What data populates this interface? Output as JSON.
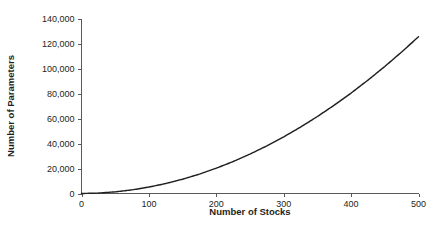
{
  "chart_data": {
    "type": "line",
    "title": "",
    "subtitle": "",
    "xlabel": "Number of Stocks",
    "ylabel": "Number of Parameters",
    "xlim": [
      0,
      500
    ],
    "ylim": [
      0,
      140000
    ],
    "xticks": [
      0,
      100,
      200,
      300,
      400,
      500
    ],
    "xtick_labels": [
      "0",
      "100",
      "200",
      "300",
      "400",
      "500"
    ],
    "yticks": [
      0,
      20000,
      40000,
      60000,
      80000,
      100000,
      120000,
      140000
    ],
    "ytick_labels": [
      "0",
      "20,000",
      "40,000",
      "60,000",
      "80,000",
      "100,000",
      "120,000",
      "140,000"
    ],
    "grid": false,
    "legend": false,
    "legend_position": "none",
    "series": [
      {
        "name": "Number of Parameters",
        "color": "#231f20",
        "formula": "N(N+3)/2",
        "x": [
          0,
          25,
          50,
          75,
          100,
          125,
          150,
          175,
          200,
          225,
          250,
          275,
          300,
          325,
          350,
          375,
          400,
          425,
          450,
          475,
          500
        ],
        "values": [
          0,
          350,
          1325,
          2925,
          5150,
          8000,
          11475,
          15575,
          20300,
          25650,
          31625,
          38225,
          45450,
          53300,
          61775,
          70875,
          80600,
          90950,
          101925,
          113525,
          125750
        ]
      }
    ],
    "annotations": [],
    "colors": {
      "curve": "#231f20",
      "axis": "#58595b",
      "text": "#231f20",
      "background": "#ffffff"
    }
  },
  "axes": {
    "x_axis_label": "Number of Stocks",
    "y_axis_label": "Number of Parameters"
  }
}
